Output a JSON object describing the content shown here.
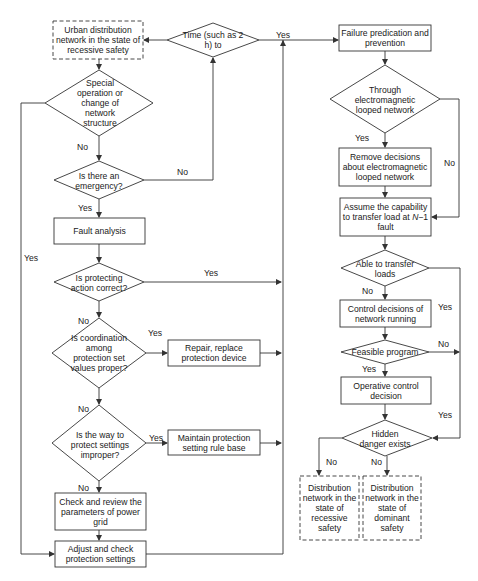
{
  "nodes": {
    "start": {
      "text": "Urban distribution network in the state of recessive safety",
      "shape": "dashed-box"
    },
    "time": {
      "text": "Time (such as 2 h) to",
      "shape": "diamond"
    },
    "special_op": {
      "text": "Special operation or change of network structure",
      "shape": "diamond"
    },
    "emergency": {
      "text": "Is there an emergency?",
      "shape": "diamond"
    },
    "fault_analysis": {
      "text": "Fault analysis",
      "shape": "box"
    },
    "protecting_action": {
      "text": "Is protecting action correct?",
      "shape": "diamond"
    },
    "coordination": {
      "text": "Is coordination among protection set values proper?",
      "shape": "diamond"
    },
    "repair": {
      "text": "Repair, replace protection device",
      "shape": "box"
    },
    "way_to_protect": {
      "text": "Is the way to protect settings improper?",
      "shape": "diamond"
    },
    "maintain": {
      "text": "Maintain protection setting rule base",
      "shape": "box"
    },
    "check_review": {
      "text": "Check and review the parameters of power grid",
      "shape": "box"
    },
    "adjust": {
      "text": "Adjust and check protection settings",
      "shape": "box"
    },
    "failure_pred": {
      "text": "Failure predication and prevention",
      "shape": "box"
    },
    "through_em": {
      "text": "Through electromagnetic looped network",
      "shape": "diamond"
    },
    "remove_decisions": {
      "text": "Remove decisions about electromagnetic looped network",
      "shape": "box"
    },
    "assume_capability": {
      "text_pre": "Assume the capability to transfer load at ",
      "text_n": "N",
      "text_post": "−1 fault",
      "shape": "box"
    },
    "able_transfer": {
      "text": "Able to transfer loads",
      "shape": "diamond"
    },
    "control_decisions": {
      "text": "Control decisions of network running",
      "shape": "box"
    },
    "feasible": {
      "text": "Feasible program",
      "shape": "diamond"
    },
    "operative": {
      "text": "Operative control decision",
      "shape": "box"
    },
    "hidden_danger": {
      "text": "Hidden danger exists",
      "shape": "diamond"
    },
    "end_recessive": {
      "text": "Distribution network in the state of recessive safety",
      "shape": "dashed-box"
    },
    "end_dominant": {
      "text": "Distribution network in the state of dominant safety",
      "shape": "dashed-box"
    }
  },
  "edge_labels": {
    "time_yes": "Yes",
    "special_no": "No",
    "special_yes": "Yes",
    "emergency_no": "No",
    "emergency_yes": "Yes",
    "protecting_yes": "Yes",
    "protecting_no": "No",
    "coordination_yes": "Yes",
    "way_no": "No",
    "way_yes": "Yes",
    "check_no": "No",
    "through_yes": "Yes",
    "through_no": "No",
    "able_no": "No",
    "able_yes": "Yes",
    "feasible_yes": "Yes",
    "feasible_no": "No",
    "hidden_yes": "Yes",
    "hidden_no_left": "No",
    "hidden_no_right": "No"
  },
  "colors": {
    "stroke": "#333333",
    "text": "#1a1a1a",
    "background": "#ffffff"
  }
}
